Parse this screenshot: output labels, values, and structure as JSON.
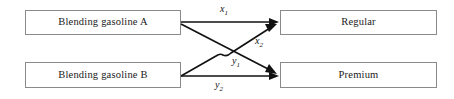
{
  "diagram": {
    "type": "flow-diagram",
    "background_color": "#ffffff",
    "box_border_color": "#8a8a8a",
    "edge_color": "#111111",
    "nodes": [
      {
        "id": "gasoline_a",
        "label": "Blending gasoline A",
        "side": "left",
        "row": "top"
      },
      {
        "id": "gasoline_b",
        "label": "Blending gasoline B",
        "side": "left",
        "row": "bottom"
      },
      {
        "id": "regular",
        "label": "Regular",
        "side": "right",
        "row": "top"
      },
      {
        "id": "premium",
        "label": "Premium",
        "side": "right",
        "row": "bottom"
      }
    ],
    "edges": [
      {
        "id": "x1",
        "from": "gasoline_a",
        "to": "regular",
        "var": "x",
        "sub": "1"
      },
      {
        "id": "x2",
        "from": "gasoline_b",
        "to": "regular",
        "var": "x",
        "sub": "2"
      },
      {
        "id": "y1",
        "from": "gasoline_a",
        "to": "premium",
        "var": "y",
        "sub": "1"
      },
      {
        "id": "y2",
        "from": "gasoline_b",
        "to": "premium",
        "var": "y",
        "sub": "2"
      }
    ]
  }
}
